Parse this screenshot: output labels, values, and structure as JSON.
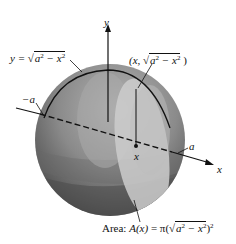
{
  "figure": {
    "type": "solid-of-revolution sphere diagram",
    "colors": {
      "sphere_dark": "#3a3a3a",
      "sphere_mid": "#7a7a7a",
      "sphere_light": "#b8b8b8",
      "cross_section": "#cfcfcf",
      "ink": "#111111"
    }
  },
  "labels": {
    "y_axis": "y",
    "x_axis": "x",
    "curve_eq_lhs": "y = ",
    "curve_eq_rad": "a",
    "curve_eq_rad_exp": "2",
    "curve_eq_rad_rest": " − x",
    "curve_eq_rad_exp2": "2",
    "point_open": "(x, ",
    "point_rad": "a",
    "point_rad_exp": "2",
    "point_rad_rest": " − x",
    "point_rad_exp2": "2",
    "point_close": " )",
    "neg_a": "−a",
    "pos_a": "a",
    "x_point": "x",
    "area_prefix": "Area: ",
    "area_func": "A(x)",
    "area_eq": " = π(",
    "area_rad": "a",
    "area_rad_exp": "2",
    "area_rad_rest": " − x",
    "area_rad_exp2": "2",
    "area_close": ")",
    "area_outer_exp": "2"
  }
}
